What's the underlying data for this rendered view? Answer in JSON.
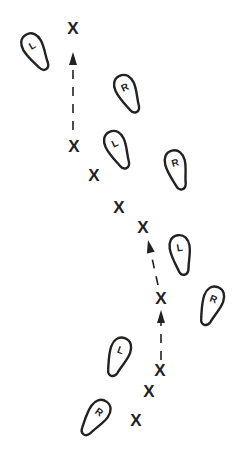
{
  "diagram": {
    "title": "",
    "line_color": "#222222",
    "background": "#ffffff",
    "footprints": [
      {
        "id": "fp1",
        "label": "L",
        "x": 36,
        "y": 52,
        "rotate": -30
      },
      {
        "id": "fp2",
        "label": "R",
        "x": 128,
        "y": 94,
        "rotate": -25
      },
      {
        "id": "fp3",
        "label": "L",
        "x": 118,
        "y": 150,
        "rotate": -25
      },
      {
        "id": "fp4",
        "label": "R",
        "x": 177,
        "y": 170,
        "rotate": -15
      },
      {
        "id": "fp5",
        "label": "L",
        "x": 181,
        "y": 255,
        "rotate": -10
      },
      {
        "id": "fp6",
        "label": "R",
        "x": 211,
        "y": 306,
        "rotate": 20
      },
      {
        "id": "fp7",
        "label": "L",
        "x": 118,
        "y": 357,
        "rotate": 20
      },
      {
        "id": "fp8",
        "label": "R",
        "x": 95,
        "y": 418,
        "rotate": 35
      }
    ],
    "marks": [
      {
        "id": "x1",
        "label": "X",
        "x": 73,
        "y": 28
      },
      {
        "id": "x2",
        "label": "X",
        "x": 74,
        "y": 146
      },
      {
        "id": "x3",
        "label": "X",
        "x": 94,
        "y": 175
      },
      {
        "id": "x4",
        "label": "X",
        "x": 119,
        "y": 207
      },
      {
        "id": "x5",
        "label": "X",
        "x": 143,
        "y": 227
      },
      {
        "id": "x6",
        "label": "X",
        "x": 161,
        "y": 298
      },
      {
        "id": "x7",
        "label": "X",
        "x": 160,
        "y": 370
      },
      {
        "id": "x8",
        "label": "X",
        "x": 149,
        "y": 391
      },
      {
        "id": "x9",
        "label": "X",
        "x": 136,
        "y": 420
      }
    ],
    "arrows": [
      {
        "id": "a1",
        "from": [
          73,
          130
        ],
        "to": [
          73,
          52
        ]
      },
      {
        "id": "a2",
        "from": [
          158,
          285
        ],
        "to": [
          148,
          240
        ]
      },
      {
        "id": "a3",
        "from": [
          161,
          360
        ],
        "to": [
          161,
          310
        ]
      }
    ]
  }
}
